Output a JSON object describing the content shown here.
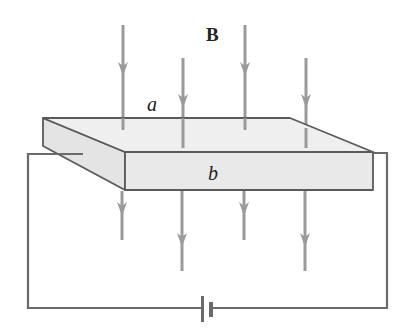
{
  "diagram": {
    "type": "physics-hall-effect",
    "labels": {
      "field": "B",
      "top_edge": "a",
      "front_edge": "b"
    },
    "colors": {
      "field_lines": "#9a9a9a",
      "slab_fill": "#ececec",
      "slab_edge": "#5a5a5a",
      "wire": "#6a6a6a",
      "text": "#222222"
    },
    "field_lines": [
      {
        "x": 123,
        "above": [
          25,
          130
        ],
        "arrow_above": 68,
        "below": [
          190,
          240
        ],
        "arrow_below": 208
      },
      {
        "x": 183,
        "above": [
          58,
          148
        ],
        "arrow_above": 100,
        "below": [
          190,
          271
        ],
        "arrow_below": 240
      },
      {
        "x": 245,
        "above": [
          25,
          130
        ],
        "arrow_above": 68,
        "below": [
          190,
          240
        ],
        "arrow_below": 208
      },
      {
        "x": 306,
        "above": [
          58,
          148
        ],
        "arrow_above": 100,
        "below": [
          190,
          271
        ],
        "arrow_below": 240
      }
    ],
    "components": [
      "conducting slab",
      "battery",
      "connecting wires",
      "magnetic field lines"
    ]
  }
}
